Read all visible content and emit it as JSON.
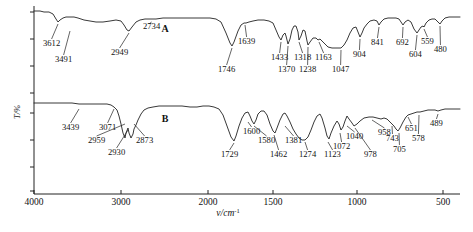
{
  "figure": {
    "type": "ir-spectra",
    "xlabel_main": "ν/cm",
    "xlabel_sup": "-1",
    "ylabel": "T/%",
    "series_labels": [
      "A",
      "B"
    ]
  },
  "axes": {
    "x_ticks": [
      {
        "label": "4000",
        "value": 4000,
        "x": 34
      },
      {
        "label": "3000",
        "value": 3000,
        "x": 121
      },
      {
        "label": "2000",
        "value": 2000,
        "x": 208
      },
      {
        "label": "1500",
        "value": 1500,
        "x": 273
      },
      {
        "label": "1000",
        "value": 1000,
        "x": 357
      },
      {
        "label": "500",
        "value": 500,
        "x": 443
      }
    ],
    "x_axis_y": 194,
    "y_axis_x": 34,
    "y_ticks_y": [
      12,
      39,
      66,
      93,
      113,
      140,
      167,
      191
    ],
    "y_label_y": 112
  },
  "chart_data": {
    "type": "line",
    "title": "",
    "xlabel": "ν/cm-1",
    "ylabel": "T/%",
    "xlim": [
      4000,
      400
    ],
    "grid": false,
    "legend": "none",
    "series": [
      {
        "name": "A",
        "label_x": 165,
        "label_y": 32,
        "baseline_y": 12,
        "peaks": [
          {
            "wavenumber": 3612,
            "label": "3612",
            "px": 58,
            "py": 22,
            "lx": 43,
            "ly": 46,
            "anchor": "start"
          },
          {
            "wavenumber": 3491,
            "label": "3491",
            "px": 70,
            "py": 29,
            "lx": 55,
            "ly": 62,
            "anchor": "start"
          },
          {
            "wavenumber": 2949,
            "label": "2949",
            "px": 129,
            "py": 31,
            "lx": 111,
            "ly": 55,
            "anchor": "start"
          },
          {
            "wavenumber": 2734,
            "label": "2734",
            "px": 149,
            "py": 22,
            "lx": 143,
            "ly": 29,
            "anchor": "start"
          },
          {
            "wavenumber": 1746,
            "label": "1746",
            "px": 232,
            "py": 46,
            "lx": 218,
            "ly": 72,
            "anchor": "start"
          },
          {
            "wavenumber": 1639,
            "label": "1639",
            "px": 245,
            "py": 23,
            "lx": 238,
            "ly": 44,
            "anchor": "start"
          },
          {
            "wavenumber": 1433,
            "label": "1433",
            "px": 281,
            "py": 40,
            "lx": 271,
            "ly": 60,
            "anchor": "start"
          },
          {
            "wavenumber": 1370,
            "label": "1370",
            "px": 288,
            "py": 44,
            "lx": 278,
            "ly": 72,
            "anchor": "start"
          },
          {
            "wavenumber": 1318,
            "label": "1318",
            "px": 299,
            "py": 40,
            "lx": 294,
            "ly": 60,
            "anchor": "start"
          },
          {
            "wavenumber": 1238,
            "label": "1238",
            "px": 308,
            "py": 45,
            "lx": 299,
            "ly": 72,
            "anchor": "start"
          },
          {
            "wavenumber": 1163,
            "label": "1163",
            "px": 319,
            "py": 40,
            "lx": 315,
            "ly": 60,
            "anchor": "start"
          },
          {
            "wavenumber": 1047,
            "label": "1047",
            "px": 341,
            "py": 48,
            "lx": 332,
            "ly": 72,
            "anchor": "start"
          },
          {
            "wavenumber": 904,
            "label": "904",
            "px": 360,
            "py": 37,
            "lx": 353,
            "ly": 57,
            "anchor": "start"
          },
          {
            "wavenumber": 841,
            "label": "841",
            "px": 379,
            "py": 25,
            "lx": 371,
            "ly": 45,
            "anchor": "start"
          },
          {
            "wavenumber": 692,
            "label": "692",
            "px": 403,
            "py": 25,
            "lx": 396,
            "ly": 45,
            "anchor": "start"
          },
          {
            "wavenumber": 604,
            "label": "604",
            "px": 417,
            "py": 33,
            "lx": 409,
            "ly": 57,
            "anchor": "start"
          },
          {
            "wavenumber": 559,
            "label": "559",
            "px": 424,
            "py": 27,
            "lx": 421,
            "ly": 44,
            "anchor": "start"
          },
          {
            "wavenumber": 480,
            "label": "480",
            "px": 440,
            "py": 24,
            "lx": 434,
            "ly": 52,
            "anchor": "start"
          }
        ]
      },
      {
        "name": "B",
        "label_x": 165,
        "label_y": 122,
        "baseline_y": 103,
        "peaks": [
          {
            "wavenumber": 3439,
            "label": "3439",
            "px": 79,
            "py": 107,
            "lx": 62,
            "ly": 130,
            "anchor": "start"
          },
          {
            "wavenumber": 3071,
            "label": "3071",
            "px": 114,
            "py": 107,
            "lx": 99,
            "ly": 130,
            "anchor": "start"
          },
          {
            "wavenumber": 2959,
            "label": "2959",
            "px": 125,
            "py": 122,
            "lx": 88,
            "ly": 143,
            "anchor": "start"
          },
          {
            "wavenumber": 2930,
            "label": "2930",
            "px": 128,
            "py": 128,
            "lx": 108,
            "ly": 155,
            "anchor": "start"
          },
          {
            "wavenumber": 2873,
            "label": "2873",
            "px": 134,
            "py": 122,
            "lx": 136,
            "ly": 143,
            "anchor": "start"
          },
          {
            "wavenumber": 1729,
            "label": "1729",
            "px": 234,
            "py": 141,
            "lx": 221,
            "ly": 157,
            "anchor": "start"
          },
          {
            "wavenumber": 1600,
            "label": "1600",
            "px": 248,
            "py": 120,
            "lx": 243,
            "ly": 134,
            "anchor": "start"
          },
          {
            "wavenumber": 1580,
            "label": "1580",
            "px": 254,
            "py": 124,
            "lx": 258,
            "ly": 143,
            "anchor": "start"
          },
          {
            "wavenumber": 1462,
            "label": "1462",
            "px": 274,
            "py": 133,
            "lx": 270,
            "ly": 157,
            "anchor": "start"
          },
          {
            "wavenumber": 1381,
            "label": "1381",
            "px": 285,
            "py": 124,
            "lx": 285,
            "ly": 143,
            "anchor": "start"
          },
          {
            "wavenumber": 1274,
            "label": "1274",
            "px": 305,
            "py": 140,
            "lx": 299,
            "ly": 157,
            "anchor": "start"
          },
          {
            "wavenumber": 1123,
            "label": "1123",
            "px": 328,
            "py": 140,
            "lx": 324,
            "ly": 157,
            "anchor": "start"
          },
          {
            "wavenumber": 1072,
            "label": "1072",
            "px": 340,
            "py": 131,
            "lx": 333,
            "ly": 149,
            "anchor": "start"
          },
          {
            "wavenumber": 1040,
            "label": "1040",
            "px": 347,
            "py": 124,
            "lx": 346,
            "ly": 139,
            "anchor": "start"
          },
          {
            "wavenumber": 978,
            "label": "978",
            "px": 355,
            "py": 126,
            "lx": 364,
            "ly": 157,
            "anchor": "start"
          },
          {
            "wavenumber": 958,
            "label": "958",
            "px": 372,
            "py": 118,
            "lx": 378,
            "ly": 135,
            "anchor": "start"
          },
          {
            "wavenumber": 743,
            "label": "743",
            "px": 392,
            "py": 124,
            "lx": 386,
            "ly": 141,
            "anchor": "start"
          },
          {
            "wavenumber": 705,
            "label": "705",
            "px": 399,
            "py": 131,
            "lx": 393,
            "ly": 152,
            "anchor": "start"
          },
          {
            "wavenumber": 651,
            "label": "651",
            "px": 408,
            "py": 115,
            "lx": 405,
            "ly": 131,
            "anchor": "start"
          },
          {
            "wavenumber": 578,
            "label": "578",
            "px": 419,
            "py": 113,
            "lx": 412,
            "ly": 141,
            "anchor": "start"
          },
          {
            "wavenumber": 489,
            "label": "489",
            "px": 438,
            "py": 112,
            "lx": 430,
            "ly": 126,
            "anchor": "start"
          }
        ]
      }
    ],
    "paths": {
      "A": "M34,11 L40,11 L44,12 L49,12 L53,14 L56,19 L58,22 L60,20 L63,18 L66,17 L70,17 L74,17 L78,18 L84,20 L90,21 L96,22 L103,22 L110,21 L116,20 L121,21 L124,25 L127,30 L129,31 L132,27 L136,22 L140,20 L145,19 L150,19 L156,19 L163,18 L170,18 L178,18 L186,18 L194,18 L202,18 L210,18 L216,19 L221,22 L226,33 L230,43 L232,46 L234,42 L238,31 L241,25 L244,23 L246,23 L249,22 L253,21 L258,20 L264,20 L269,21 L273,23 L276,30 L279,37 L281,40 L283,35 L285,33 L286,36 L288,44 L290,39 L292,30 L294,26 L296,26 L298,32 L299,40 L301,36 L303,30 L305,31 L307,41 L308,45 L310,42 L313,38 L316,38 L318,40 L320,39 L322,41 L325,44 L328,47 L332,48 L336,48 L341,48 L344,45 L347,40 L350,33 L353,28 L356,27 L358,32 L360,37 L362,33 L364,28 L367,24 L370,21 L374,20 L377,21 L379,25 L381,22 L384,19 L388,18 L392,18 L396,18 L399,19 L401,22 L403,25 L405,22 L408,20 L411,22 L414,29 L417,33 L419,30 L421,27 L423,26 L424,27 L426,23 L429,20 L432,19 L435,19 L437,21 L440,24 L442,21 L445,18 L449,17 L454,17 L460,17",
      "B": "M34,103 L45,103 L55,103 L65,103 L72,103 L79,104 L86,104 L94,104 L101,104 L107,104 L111,105 L114,107 L117,110 L119,116 L121,124 L123,133 L125,138 L126,133 L128,128 L129,133 L131,138 L133,134 L134,129 L136,125 L138,120 L141,114 L144,110 L148,108 L153,107 L159,106 L166,106 L174,106 L182,106 L190,107 L197,107 L203,106 L209,106 L214,107 L219,109 L223,115 L227,126 L231,137 L234,141 L236,136 L239,126 L242,118 L245,113 L248,112 L250,116 L252,121 L254,124 L256,120 L258,114 L261,111 L264,111 L267,115 L270,124 L273,131 L275,133 L277,128 L280,120 L283,114 L285,113 L287,116 L290,122 L293,129 L296,134 L299,138 L302,140 L305,140 L308,137 L311,130 L314,122 L317,116 L320,114 L322,118 L325,128 L327,136 L329,139 L331,133 L334,126 L337,121 L339,124 L341,130 L343,127 L345,121 L347,116 L349,119 L352,123 L354,126 L357,124 L360,121 L364,118 L369,117 L373,117 L377,118 L381,119 L384,118 L387,119 L390,122 L392,124 L394,126 L396,129 L398,131 L400,128 L403,122 L406,117 L408,115 L411,114 L414,113 L417,112 L420,112 L424,111 L428,110 L432,110 L435,110 L438,111 L441,110 L445,109 L452,109 L460,109"
    }
  }
}
